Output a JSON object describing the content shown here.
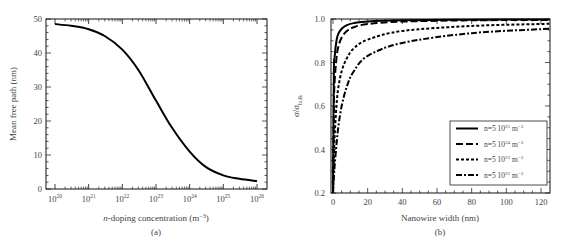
{
  "chart_data": [
    {
      "type": "line",
      "panel_label": "(a)",
      "title": "",
      "xlabel": "n-doping concentration (m⁻³)",
      "ylabel": "Mean free path (nm)",
      "xscale": "log",
      "xlim": [
        1e+20,
        1e+26
      ],
      "ylim": [
        0,
        50
      ],
      "x_tick_labels": [
        "10^20",
        "10^21",
        "10^22",
        "10^23",
        "10^24",
        "10^25",
        "10^26"
      ],
      "y_tick_labels": [
        "0",
        "10",
        "20",
        "30",
        "40",
        "50"
      ],
      "grid": false,
      "series": [
        {
          "name": "mean free path",
          "x": [
            1e+20,
            3e+20,
            1e+21,
            3e+21,
            1e+22,
            3e+22,
            1e+23,
            3e+23,
            1e+24,
            3e+24,
            1e+25,
            3e+25,
            1e+26
          ],
          "values": [
            48.5,
            48.0,
            47.0,
            45.0,
            41.0,
            35.0,
            26.0,
            18.0,
            11.0,
            6.5,
            4.0,
            3.0,
            2.3
          ]
        }
      ]
    },
    {
      "type": "line",
      "panel_label": "(b)",
      "title": "",
      "xlabel": "Nanowire width (nm)",
      "ylabel": "σ/σbulk",
      "xlim": [
        -2,
        126
      ],
      "ylim": [
        0.2,
        1.0
      ],
      "x_tick_labels": [
        "0",
        "20",
        "40",
        "60",
        "80",
        "100",
        "120"
      ],
      "y_tick_labels": [
        "0.2",
        "0.4",
        "0.6",
        "0.8",
        "1.0"
      ],
      "grid": false,
      "legend_position": "lower right",
      "series": [
        {
          "name": "n=5 10^25 m^-3",
          "linestyle": "solid",
          "x": [
            0,
            0.5,
            1,
            2,
            3,
            5,
            8,
            12,
            20,
            40,
            80,
            125
          ],
          "values": [
            0.2,
            0.75,
            0.83,
            0.9,
            0.93,
            0.955,
            0.972,
            0.981,
            0.989,
            0.994,
            0.997,
            0.998
          ]
        },
        {
          "name": "n=5 10^24 m^-3",
          "linestyle": "long-dash",
          "x": [
            0,
            0.5,
            1,
            2,
            3,
            5,
            8,
            12,
            20,
            40,
            80,
            125
          ],
          "values": [
            0.2,
            0.6,
            0.72,
            0.82,
            0.87,
            0.915,
            0.945,
            0.962,
            0.977,
            0.988,
            0.994,
            0.996
          ]
        },
        {
          "name": "n=5 10^23 m^-3",
          "linestyle": "short-dash",
          "x": [
            0,
            0.5,
            1,
            2,
            3,
            5,
            8,
            12,
            20,
            40,
            80,
            125
          ],
          "values": [
            0.2,
            0.36,
            0.47,
            0.6,
            0.68,
            0.76,
            0.82,
            0.865,
            0.905,
            0.945,
            0.968,
            0.978
          ]
        },
        {
          "name": "n=5 10^22 m^-3",
          "linestyle": "dash-dot",
          "x": [
            0,
            0.5,
            1,
            2,
            3,
            5,
            8,
            12,
            20,
            40,
            80,
            125
          ],
          "values": [
            0.2,
            0.27,
            0.33,
            0.42,
            0.5,
            0.6,
            0.69,
            0.76,
            0.83,
            0.89,
            0.935,
            0.955
          ]
        }
      ]
    }
  ],
  "labels": {
    "a_xlabel_italic": "n",
    "a_xlabel_rest": "-doping concentration (m",
    "a_xlabel_exp": "−3",
    "a_xlabel_close": ")",
    "a_panel": "(a)",
    "a_ylabel": "Mean free path (nm)",
    "b_xlabel": "Nanowire width (nm)",
    "b_panel": "(b)",
    "b_ylabel_main": "σ/σ",
    "b_ylabel_sub": "bulk"
  },
  "legend": [
    {
      "prefix": "n=5 10",
      "exp": "25",
      "unit": " m",
      "unit_exp": "−3",
      "style": "solid"
    },
    {
      "prefix": "n=5 10",
      "exp": "24",
      "unit": " m",
      "unit_exp": "−3",
      "style": "long-dash"
    },
    {
      "prefix": "n=5 10",
      "exp": "23",
      "unit": " m",
      "unit_exp": "−3",
      "style": "short-dash"
    },
    {
      "prefix": "n=5 10",
      "exp": "22",
      "unit": " m",
      "unit_exp": "−3",
      "style": "dash-dot"
    }
  ]
}
